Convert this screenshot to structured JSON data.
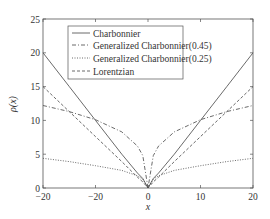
{
  "chart_data": {
    "type": "line",
    "title": "",
    "xlabel": "x",
    "ylabel": "ρ(x)",
    "xlim": [
      -20,
      20
    ],
    "ylim": [
      0,
      25
    ],
    "x_ticks": [
      -20,
      -10,
      0,
      10,
      20
    ],
    "x_tick_labels": [
      "−20",
      "−20",
      "0",
      "10",
      "20"
    ],
    "y_ticks": [
      0,
      5,
      10,
      15,
      20,
      25
    ],
    "y_tick_labels": [
      "0",
      "5",
      "10",
      "15",
      "20",
      "25"
    ],
    "grid": false,
    "legend_position": "upper center",
    "x": [
      -20,
      -15,
      -10,
      -5,
      -2,
      -1,
      0,
      1,
      2,
      5,
      10,
      15,
      20
    ],
    "series": [
      {
        "name": "Charbonnier",
        "style": "solid",
        "values": [
          20.0,
          15.0,
          10.0,
          5.0,
          2.2,
          1.4,
          0.0,
          1.4,
          2.2,
          5.0,
          10.0,
          15.0,
          20.0
        ]
      },
      {
        "name": "Generalized Charbonnier(0.45)",
        "style": "dashdot",
        "values": [
          12.2,
          11.3,
          10.1,
          8.3,
          6.2,
          4.8,
          0.0,
          4.8,
          6.2,
          8.3,
          10.1,
          11.3,
          12.2
        ]
      },
      {
        "name": "Generalized Charbonnier(0.25)",
        "style": "dotted",
        "values": [
          4.4,
          3.9,
          3.3,
          2.6,
          1.8,
          1.3,
          0.0,
          1.3,
          1.8,
          2.6,
          3.3,
          3.9,
          4.4
        ]
      },
      {
        "name": "Lorentzian",
        "style": "dashed",
        "values": [
          15.0,
          11.3,
          7.6,
          3.9,
          1.6,
          0.9,
          0.0,
          0.9,
          1.6,
          3.9,
          7.6,
          11.3,
          15.0
        ]
      }
    ]
  },
  "legend": {
    "items": [
      "Charbonnier",
      "Generalized Charbonnier(0.45)",
      "Generalized Charbonnier(0.25)",
      "Lorentzian"
    ]
  },
  "axes": {
    "xlabel": "x",
    "ylabel": "ρ(x)"
  }
}
